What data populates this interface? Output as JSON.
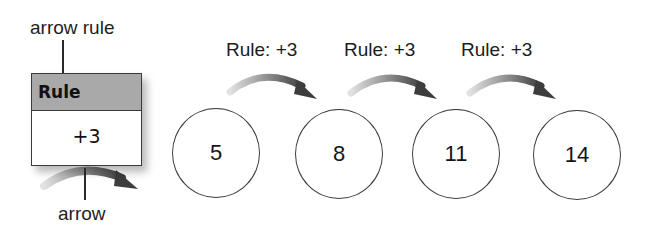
{
  "callouts": {
    "arrow_rule": "arrow rule",
    "arrow": "arrow"
  },
  "key": {
    "header": "Rule",
    "value": "+3"
  },
  "sequence": {
    "terms": [
      "5",
      "8",
      "11",
      "14"
    ],
    "rule_labels": [
      "Rule: +3",
      "Rule: +3",
      "Rule: +3"
    ]
  },
  "colors": {
    "header_fill": "#a9a9a9",
    "arrow_dark": "#4a4a4a",
    "arrow_light": "#d8d8d8",
    "stroke": "#3a3a3a"
  }
}
